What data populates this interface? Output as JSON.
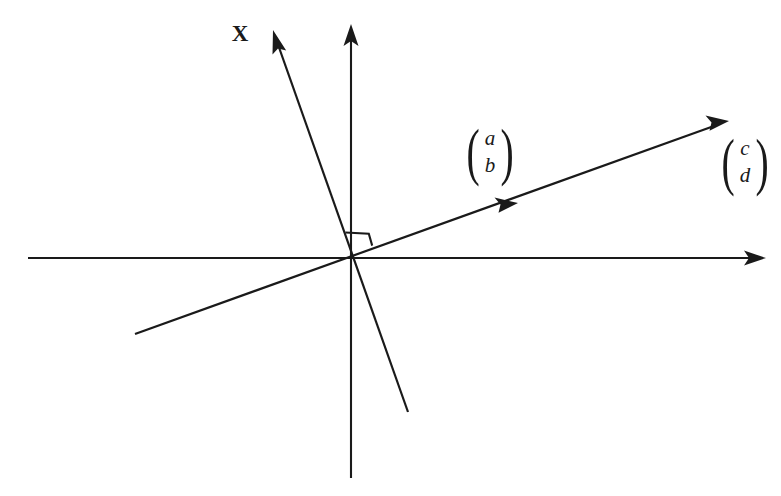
{
  "figure": {
    "background_color": "#ffffff",
    "stroke_color": "#1a1a1a",
    "width": 781,
    "height": 496
  },
  "labels": {
    "x_axis_vector": "X",
    "vector_ab": {
      "top": "a",
      "bottom": "b"
    },
    "vector_cd": {
      "top": "c",
      "bottom": "d"
    },
    "paren_open": "(",
    "paren_close": ")"
  },
  "geometry": {
    "origin": {
      "x": 353,
      "y": 258
    },
    "horizontal_axis": {
      "x1": 28,
      "y1": 258,
      "x2": 765,
      "y2": 258,
      "arrow": "right"
    },
    "vertical_axis": {
      "x1": 351,
      "y1": 478,
      "x2": 351,
      "y2": 24,
      "arrow": "top"
    },
    "x_line": {
      "x1": 408,
      "y1": 412,
      "x2": 273,
      "y2": 30,
      "arrow": "end"
    },
    "ab_line": {
      "x1": 135,
      "y1": 334,
      "x2": 729,
      "y2": 121,
      "arrow": "end",
      "mid_arrow": {
        "x": 512,
        "y": 205
      }
    },
    "right_angle_marker": {
      "x": 360,
      "y": 241,
      "size": 25
    },
    "label_positions": {
      "x_axis_vector": {
        "x": 240,
        "y": 33
      },
      "vector_ab": {
        "x": 490,
        "y": 152
      },
      "vector_cd": {
        "x": 745,
        "y": 162
      }
    }
  }
}
